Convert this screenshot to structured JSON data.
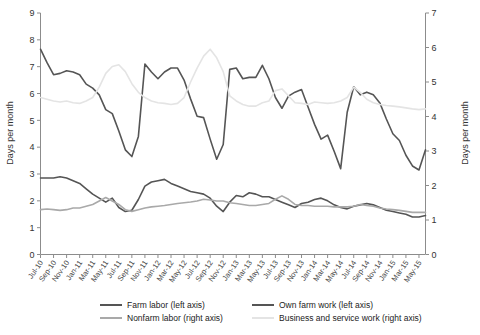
{
  "chart_data": {
    "type": "line",
    "title": "",
    "xlabel": "",
    "ylabel": "Days per month",
    "y2label": "Days per month",
    "ylim": [
      0,
      9
    ],
    "y2lim": [
      0,
      7
    ],
    "yticks": [
      0,
      1,
      2,
      3,
      4,
      5,
      6,
      7,
      8,
      9
    ],
    "y2ticks": [
      0,
      1,
      2,
      3,
      4,
      5,
      6,
      7
    ],
    "grid": false,
    "legend_position": "bottom",
    "x_tick_labels": [
      "Jul-10",
      "Sep-10",
      "Nov-10",
      "Jan-11",
      "Mar-11",
      "May-11",
      "Jul-11",
      "Sep-11",
      "Nov-11",
      "Jan-12",
      "Mar-12",
      "May-12",
      "Jul-12",
      "Sep-12",
      "Nov-12",
      "Jan-13",
      "Mar-13",
      "May-13",
      "Jul-13",
      "Sep-13",
      "Nov-13",
      "Jan-14",
      "Mar-14",
      "May-14",
      "Jul-14",
      "Sep-14",
      "Nov-14",
      "Jan-15",
      "Mar-15",
      "May-15"
    ],
    "x": [
      "Jul-10",
      "Aug-10",
      "Sep-10",
      "Oct-10",
      "Nov-10",
      "Dec-10",
      "Jan-11",
      "Feb-11",
      "Mar-11",
      "Apr-11",
      "May-11",
      "Jun-11",
      "Jul-11",
      "Aug-11",
      "Sep-11",
      "Oct-11",
      "Nov-11",
      "Dec-11",
      "Jan-12",
      "Feb-12",
      "Mar-12",
      "Apr-12",
      "May-12",
      "Jun-12",
      "Jul-12",
      "Aug-12",
      "Sep-12",
      "Oct-12",
      "Nov-12",
      "Dec-12",
      "Jan-13",
      "Feb-13",
      "Mar-13",
      "Apr-13",
      "May-13",
      "Jun-13",
      "Jul-13",
      "Aug-13",
      "Sep-13",
      "Oct-13",
      "Nov-13",
      "Dec-13",
      "Jan-14",
      "Feb-14",
      "Mar-14",
      "Apr-14",
      "May-14",
      "Jun-14",
      "Jul-14",
      "Aug-14",
      "Sep-14",
      "Oct-14",
      "Nov-14",
      "Dec-14",
      "Jan-15",
      "Feb-15",
      "Mar-15",
      "Apr-15",
      "May-15",
      "Jun-15"
    ],
    "series": [
      {
        "name": "Farm labor (left axis)",
        "axis": "left",
        "color": "#555555",
        "values": [
          7.65,
          7.15,
          6.7,
          6.75,
          6.85,
          6.8,
          6.7,
          6.35,
          6.2,
          5.95,
          5.4,
          5.25,
          4.6,
          3.9,
          3.65,
          4.4,
          7.1,
          6.8,
          6.55,
          6.8,
          6.95,
          6.95,
          6.5,
          5.8,
          5.15,
          5.1,
          4.3,
          3.55,
          4.1,
          6.9,
          6.95,
          6.55,
          6.6,
          6.6,
          7.05,
          6.55,
          5.85,
          5.45,
          5.9,
          6.05,
          6.15,
          5.5,
          4.85,
          4.3,
          4.45,
          3.85,
          3.2,
          5.3,
          6.25,
          5.95,
          6.05,
          5.95,
          5.65,
          5.05,
          4.5,
          4.25,
          3.7,
          3.3,
          3.15,
          3.9
        ]
      },
      {
        "name": "Own farm work (left axis)",
        "axis": "left",
        "color": "#555555",
        "values": [
          2.85,
          2.85,
          2.85,
          2.9,
          2.85,
          2.75,
          2.65,
          2.45,
          2.25,
          2.1,
          1.95,
          2.1,
          1.75,
          1.6,
          1.65,
          2.05,
          2.55,
          2.7,
          2.75,
          2.8,
          2.65,
          2.55,
          2.45,
          2.35,
          2.3,
          2.25,
          2.1,
          1.8,
          1.6,
          1.95,
          2.2,
          2.15,
          2.3,
          2.25,
          2.15,
          2.15,
          2.05,
          1.95,
          1.85,
          1.75,
          1.9,
          1.95,
          2.05,
          2.1,
          2.0,
          1.85,
          1.75,
          1.7,
          1.8,
          1.85,
          1.9,
          1.85,
          1.75,
          1.65,
          1.6,
          1.55,
          1.5,
          1.4,
          1.4,
          1.45
        ]
      },
      {
        "name": "Nonfarm labor (right axis)",
        "axis": "right",
        "color": "#a9a9a9",
        "values": [
          1.3,
          1.32,
          1.3,
          1.28,
          1.3,
          1.35,
          1.35,
          1.4,
          1.45,
          1.55,
          1.65,
          1.55,
          1.45,
          1.3,
          1.25,
          1.3,
          1.35,
          1.38,
          1.4,
          1.42,
          1.45,
          1.48,
          1.5,
          1.52,
          1.55,
          1.6,
          1.58,
          1.55,
          1.55,
          1.5,
          1.48,
          1.45,
          1.42,
          1.42,
          1.45,
          1.48,
          1.6,
          1.7,
          1.6,
          1.45,
          1.42,
          1.42,
          1.4,
          1.4,
          1.4,
          1.38,
          1.38,
          1.38,
          1.4,
          1.45,
          1.42,
          1.4,
          1.35,
          1.32,
          1.3,
          1.28,
          1.25,
          1.22,
          1.22,
          1.22
        ]
      },
      {
        "name": "Business and service work (right axis)",
        "axis": "right",
        "color": "#e4e4e4",
        "values": [
          4.55,
          4.5,
          4.45,
          4.42,
          4.45,
          4.4,
          4.38,
          4.45,
          4.55,
          4.85,
          5.25,
          5.45,
          5.5,
          5.3,
          4.95,
          4.7,
          4.55,
          4.45,
          4.4,
          4.38,
          4.35,
          4.38,
          4.55,
          5.0,
          5.4,
          5.75,
          5.95,
          5.7,
          5.3,
          4.6,
          4.45,
          4.35,
          4.3,
          4.3,
          4.4,
          4.45,
          4.75,
          4.8,
          4.6,
          4.4,
          4.38,
          4.35,
          4.42,
          4.4,
          4.38,
          4.4,
          4.45,
          4.55,
          4.85,
          4.7,
          4.5,
          4.4,
          4.35,
          4.32,
          4.3,
          4.28,
          4.25,
          4.22,
          4.2,
          4.22
        ]
      }
    ],
    "legend": [
      {
        "label": "Farm labor (left axis)",
        "color": "#555555"
      },
      {
        "label": "Own farm work (left axis)",
        "color": "#555555"
      },
      {
        "label": "Nonfarm labor (right axis)",
        "color": "#a9a9a9"
      },
      {
        "label": "Business and service work (right axis)",
        "color": "#e4e4e4"
      }
    ]
  },
  "axes": {
    "left_title": "Days per month",
    "right_title": "Days per month"
  }
}
